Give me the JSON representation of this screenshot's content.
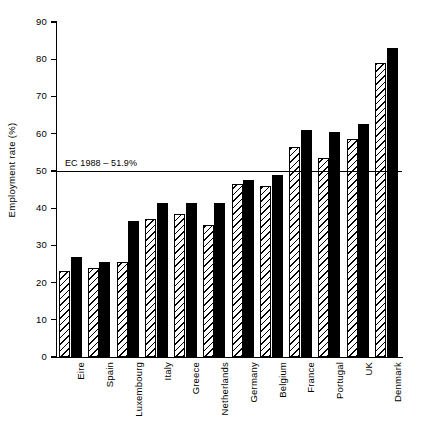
{
  "chart_data": {
    "type": "bar",
    "title": "",
    "xlabel": "",
    "ylabel": "Employment rate (%)",
    "ylim": [
      0,
      90
    ],
    "yticks": [
      0,
      10,
      20,
      30,
      40,
      50,
      60,
      70,
      80,
      90
    ],
    "grid": false,
    "legend_position": "none",
    "categories": [
      "Eire",
      "Spain",
      "Luxembourg",
      "Italy",
      "Greece",
      "Netherlands",
      "Germany",
      "Belgium",
      "France",
      "Portugal",
      "UK",
      "Denmark"
    ],
    "series": [
      {
        "name": "hatched",
        "pattern": "diagonal-hatch",
        "values": [
          23,
          24,
          25.5,
          37,
          38.5,
          35.5,
          46.5,
          46,
          56.5,
          53.5,
          58.5,
          79
        ]
      },
      {
        "name": "solid",
        "pattern": "solid-black",
        "values": [
          27,
          25.5,
          36.5,
          41.5,
          41.5,
          41.5,
          47.5,
          49,
          61,
          60.5,
          62.5,
          83
        ]
      }
    ],
    "annotations": [
      {
        "name": "ec-average-line",
        "label": "EC 1988 – 51.9%",
        "value": 51.9,
        "draw_at": 50,
        "orientation": "horizontal"
      }
    ]
  },
  "colors": {
    "axis": "#000000",
    "bar_solid": "#000000",
    "bar_hatch_bg": "#ffffff",
    "background": "#ffffff"
  }
}
